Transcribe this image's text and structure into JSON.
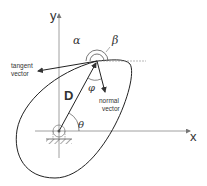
{
  "diagram": {
    "axes": {
      "x_label": "x",
      "y_label": "y"
    },
    "labels": {
      "alpha": "α",
      "beta": "β",
      "phi": "φ",
      "theta": "θ",
      "D": "D",
      "tangent_line1": "tangent",
      "tangent_line2": "vector",
      "normal_line1": "normal",
      "normal_line2": "vector"
    },
    "colors": {
      "stroke": "#333333",
      "axis": "#888888",
      "background": "#ffffff"
    }
  }
}
